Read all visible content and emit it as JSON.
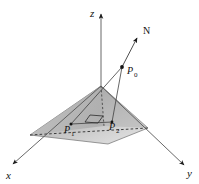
{
  "figure": {
    "background_color": "#ffffff",
    "line_color": "#4a4a4a",
    "label_color": "#111111"
  },
  "axes": [
    {
      "name": "z-axis",
      "label": "z",
      "label_x": 90,
      "label_y": 17,
      "from_x": 101,
      "from_y": 86,
      "to_x": 101,
      "to_y": 11
    },
    {
      "name": "x-axis",
      "label": "x",
      "label_x": 6,
      "label_y": 179,
      "from_x": 101,
      "from_y": 86,
      "to_x": 11,
      "to_y": 166
    },
    {
      "name": "y-axis",
      "label": "y",
      "label_x": 187,
      "label_y": 177,
      "from_x": 101,
      "from_y": 86,
      "to_x": 186,
      "to_y": 167
    }
  ],
  "plane": {
    "name": "shaded-plane",
    "points": "101,86 30,135 108,144 148,128",
    "fill_light": "#d8d8d8",
    "fill_dark": "#9a9a9a",
    "stroke": "#6b6b6b"
  },
  "normal_vector": {
    "label": "N",
    "label_x": 145,
    "label_y": 33,
    "from_x": 122,
    "from_y": 67,
    "to_x": 138,
    "to_y": 36
  },
  "points": [
    {
      "name": "point-p0",
      "label": "P",
      "subscript": "0",
      "cx": 122,
      "cy": 67,
      "label_x": 127,
      "label_y": 73,
      "sub_x": 135,
      "sub_y": 76
    },
    {
      "name": "point-p1",
      "label": "P",
      "subscript": "1",
      "cx": 71,
      "cy": 124,
      "label_x": 65,
      "label_y": 133,
      "sub_x": 72,
      "sub_y": 136
    },
    {
      "name": "point-p2",
      "label": "P",
      "subscript": "2",
      "cx": 112,
      "cy": 122,
      "label_x": 110,
      "label_y": 130,
      "sub_x": 118,
      "sub_y": 133
    }
  ],
  "segments": [
    {
      "name": "segment-p0-to-p1",
      "from_x": 122,
      "from_y": 67,
      "to_x": 71,
      "to_y": 124
    },
    {
      "name": "segment-p0-to-p2",
      "from_x": 122,
      "from_y": 67,
      "to_x": 112,
      "to_y": 122
    },
    {
      "name": "segment-p1-to-p2",
      "from_x": 71,
      "from_y": 124,
      "to_x": 112,
      "to_y": 122
    }
  ],
  "dashed_edges": [
    {
      "name": "dashed-edge-left-front",
      "path": "M 30,135 L 148,128"
    },
    {
      "name": "dashed-vertical-apex",
      "path": "M 101,86 L 104,126"
    }
  ],
  "right_angle_marker": {
    "name": "right-angle-marker",
    "path": "M 85,122 L 90,115 L 103,116 L 98,123 Z"
  }
}
